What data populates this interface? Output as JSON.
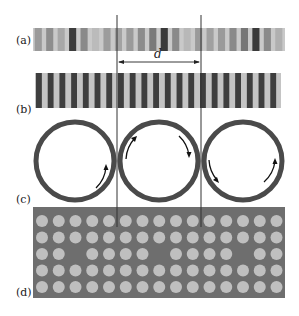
{
  "figure": {
    "panels": [
      {
        "id": "a",
        "label": "(a)",
        "description": "stripe pattern with varying intensities"
      },
      {
        "id": "b",
        "label": "(b)",
        "description": "uniform dark/light stripe grating"
      },
      {
        "id": "c",
        "label": "(c)",
        "description": "three rings with circulation arrows"
      },
      {
        "id": "d",
        "label": "(d)",
        "description": "dot array with periodic vacancies"
      }
    ],
    "period_label": "d",
    "colors": {
      "dark": "#3a3a3a",
      "mid": "#8a8a8a",
      "light": "#bdbdbd",
      "plate": "#6e6e6e",
      "dot": "#bfbfbf",
      "ring": "#4a4a4a",
      "line": "#333333"
    },
    "panel_a": {
      "stripe_shades": [
        "#9a9a9a",
        "#8e8e8e",
        "#a8a8a8",
        "#3c3c3c",
        "#8a8a8a",
        "#bbbbbb",
        "#9c9c9c",
        "#a2a2a2",
        "#9a9a9a",
        "#8c8c8c",
        "#7a7a7a",
        "#3a3a3a",
        "#8a8a8a",
        "#b8b8b8",
        "#9a9a9a",
        "#a0a0a0",
        "#9a9a9a",
        "#8a8a8a",
        "#777777",
        "#3a3a3a",
        "#8a8a8a",
        "#b0b0b0"
      ]
    },
    "panel_b": {
      "stripe_count": 21
    },
    "panel_d": {
      "rows": 5,
      "cols": 15,
      "vacancies": [
        [
          2,
          2
        ],
        [
          2,
          7
        ],
        [
          2,
          12
        ]
      ]
    }
  }
}
